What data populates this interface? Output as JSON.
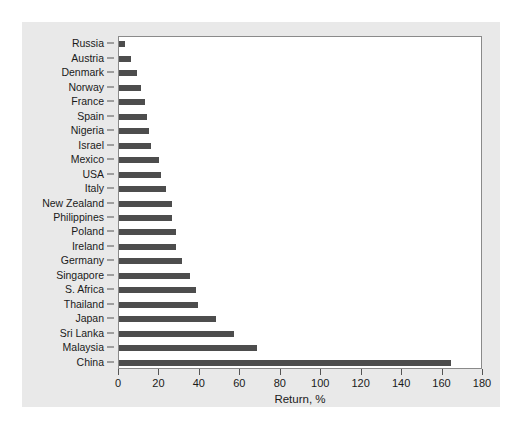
{
  "chart_data": {
    "type": "bar",
    "orientation": "horizontal",
    "title": "",
    "xlabel": "Return, %",
    "ylabel": "",
    "xlim": [
      0,
      180
    ],
    "xticks": [
      0,
      20,
      40,
      60,
      80,
      100,
      120,
      140,
      160,
      180
    ],
    "grid": false,
    "legend": null,
    "bar_color": "#4d4d4d",
    "plot_background": "#ffffff",
    "panel_background": "#e9e9e9",
    "categories": [
      "Russia",
      "Austria",
      "Denmark",
      "Norway",
      "France",
      "Spain",
      "Nigeria",
      "Israel",
      "Mexico",
      "USA",
      "Italy",
      "New Zealand",
      "Philippines",
      "Poland",
      "Ireland",
      "Germany",
      "Singapore",
      "S. Africa",
      "Thailand",
      "Japan",
      "Sri Lanka",
      "Malaysia",
      "China"
    ],
    "values": [
      3,
      6,
      9,
      11,
      13,
      14,
      15,
      16,
      20,
      21,
      23,
      26,
      26,
      28,
      28,
      31,
      35,
      38,
      39,
      48,
      57,
      68,
      164
    ]
  },
  "axis": {
    "x_title": "Return, %"
  }
}
